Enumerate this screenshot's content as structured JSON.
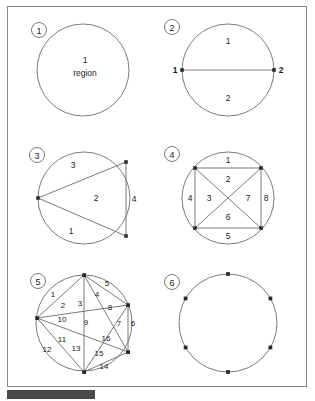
{
  "document": {
    "type": "geometry-diagram-sheet",
    "topic": "circle divided into regions by chords joining points on the circumference",
    "background_color": "#ffffff",
    "frame_color": "#8a8a8a",
    "line_color": "#6b6b6b",
    "point_color": "#2b2b2b",
    "text_color": "#1a1a1a",
    "bottom_bar_color": "#4a4a4a"
  },
  "panels": [
    {
      "id": "panel-1",
      "number_label": "1",
      "points": 0,
      "region_count": 1,
      "center_text_line1": "1",
      "center_text_line2": "region",
      "region_labels": [],
      "point_labels": []
    },
    {
      "id": "panel-2",
      "number_label": "2",
      "points": 2,
      "region_count": 2,
      "region_labels": [
        "1",
        "2"
      ],
      "point_labels": [
        "1",
        "2"
      ]
    },
    {
      "id": "panel-3",
      "number_label": "3",
      "points": 3,
      "region_count": 4,
      "region_labels": [
        "1",
        "2",
        "3",
        "4"
      ],
      "point_labels": []
    },
    {
      "id": "panel-4",
      "number_label": "4",
      "points": 4,
      "region_count": 8,
      "region_labels": [
        "1",
        "2",
        "3",
        "4",
        "5",
        "6",
        "7",
        "8"
      ],
      "point_labels": []
    },
    {
      "id": "panel-5",
      "number_label": "5",
      "points": 5,
      "region_count": 16,
      "region_labels": [
        "1",
        "2",
        "3",
        "4",
        "5",
        "6",
        "7",
        "8",
        "9",
        "10",
        "11",
        "12",
        "13",
        "14",
        "15",
        "16"
      ],
      "point_labels": []
    },
    {
      "id": "panel-6",
      "number_label": "6",
      "points": 6,
      "region_count": 0,
      "region_labels": [],
      "point_labels": []
    }
  ],
  "labels": {
    "p1_badge": "1",
    "p1_count": "1",
    "p1_word": "region",
    "p2_badge": "2",
    "p2_pt_left": "1",
    "p2_pt_right": "2",
    "p2_r1": "1",
    "p2_r2": "2",
    "p3_badge": "3",
    "p3_r1": "1",
    "p3_r2": "2",
    "p3_r3": "3",
    "p3_r4": "4",
    "p4_badge": "4",
    "p4_r1": "1",
    "p4_r2": "2",
    "p4_r3": "3",
    "p4_r4": "4",
    "p4_r5": "5",
    "p4_r6": "6",
    "p4_r7": "7",
    "p4_r8": "8",
    "p5_badge": "5",
    "p5_r1": "1",
    "p5_r2": "2",
    "p5_r3": "3",
    "p5_r4": "4",
    "p5_r5": "5",
    "p5_r6": "6",
    "p5_r7": "7",
    "p5_r8": "8",
    "p5_r9": "9",
    "p5_r10": "10",
    "p5_r11": "11",
    "p5_r12": "12",
    "p5_r13": "13",
    "p5_r14": "14",
    "p5_r15": "15",
    "p5_r16": "16",
    "p6_badge": "6"
  }
}
